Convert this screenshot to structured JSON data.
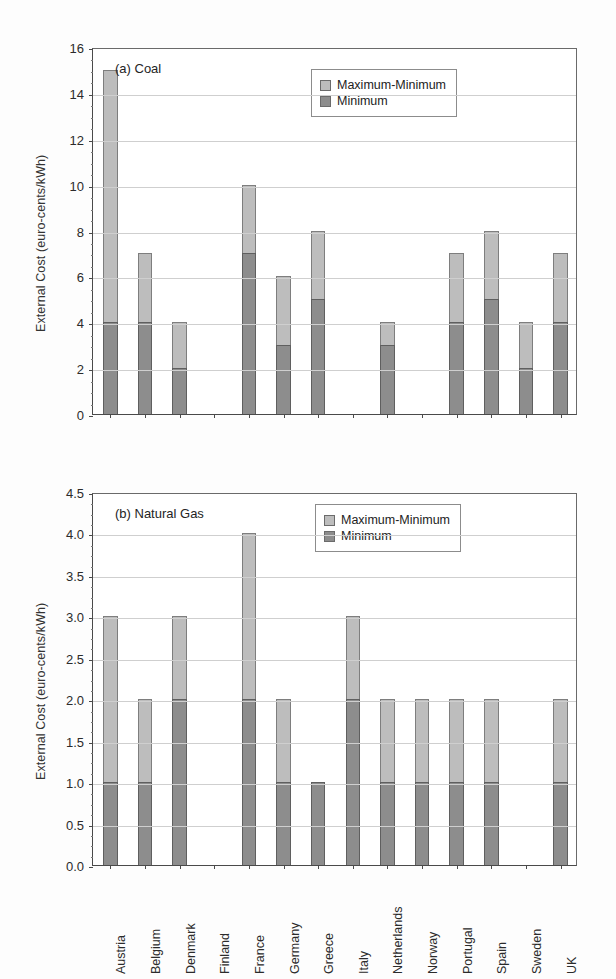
{
  "figure": {
    "ylabel": "External Cost (euro-cents/kWh)"
  },
  "legend": {
    "max_label": "Maximum-Minimum",
    "min_label": "Minimum",
    "max_color": "#bdbdbd",
    "min_color": "#8d8d8d"
  },
  "chart_data": [
    {
      "type": "bar",
      "id": "panel-a",
      "title": "(a) Coal",
      "xlabel": "",
      "ylabel": "External Cost (euro-cents/kWh)",
      "ylim": [
        0,
        16
      ],
      "yticks": [
        0,
        2,
        4,
        6,
        8,
        10,
        12,
        14,
        16
      ],
      "ytick_labels": [
        "0",
        "2",
        "4",
        "6",
        "8",
        "10",
        "12",
        "14",
        "16"
      ],
      "minor_tick_step": 0.5,
      "grid": true,
      "stacked": true,
      "legend_position": "top-right inside",
      "categories": [
        "Austria",
        "Belgium",
        "Denmark",
        "Finland",
        "France",
        "Germany",
        "Greece",
        "Italy",
        "Netherlands",
        "Norway",
        "Portugal",
        "Spain",
        "Sweden",
        "UK"
      ],
      "series": [
        {
          "name": "Minimum",
          "values": [
            4,
            4,
            2,
            null,
            7,
            3,
            5,
            null,
            3,
            null,
            4,
            5,
            2,
            4
          ]
        },
        {
          "name": "Maximum-Minimum",
          "values": [
            11,
            3,
            2,
            null,
            3,
            3,
            3,
            null,
            1,
            null,
            3,
            3,
            2,
            3
          ]
        }
      ],
      "maximum_totals": [
        15,
        7,
        4,
        null,
        10,
        6,
        8,
        null,
        4,
        null,
        7,
        8,
        4,
        7
      ],
      "no_data_categories": [
        "Finland",
        "Italy",
        "Norway"
      ]
    },
    {
      "type": "bar",
      "id": "panel-b",
      "title": "(b) Natural Gas",
      "xlabel": "",
      "ylabel": "External Cost (euro-cents/kWh)",
      "ylim": [
        0,
        4.5
      ],
      "yticks": [
        0.0,
        0.5,
        1.0,
        1.5,
        2.0,
        2.5,
        3.0,
        3.5,
        4.0,
        4.5
      ],
      "ytick_labels": [
        "0.0",
        "0.5",
        "1.0",
        "1.5",
        "2.0",
        "2.5",
        "3.0",
        "3.5",
        "4.0",
        "4.5"
      ],
      "minor_tick_step": 0.125,
      "grid": true,
      "stacked": true,
      "legend_position": "top-right inside",
      "categories": [
        "Austria",
        "Belgium",
        "Denmark",
        "Finland",
        "France",
        "Germany",
        "Greece",
        "Italy",
        "Netherlands",
        "Norway",
        "Portugal",
        "Spain",
        "Sweden",
        "UK"
      ],
      "series": [
        {
          "name": "Minimum",
          "values": [
            1.0,
            1.0,
            2.0,
            null,
            2.0,
            1.0,
            1.0,
            2.0,
            1.0,
            1.0,
            1.0,
            1.0,
            null,
            1.0
          ]
        },
        {
          "name": "Maximum-Minimum",
          "values": [
            2.0,
            1.0,
            1.0,
            null,
            2.0,
            1.0,
            0.0,
            1.0,
            1.0,
            1.0,
            1.0,
            1.0,
            null,
            1.0
          ]
        }
      ],
      "maximum_totals": [
        3.0,
        2.0,
        3.0,
        null,
        4.0,
        2.0,
        1.0,
        3.0,
        2.0,
        2.0,
        2.0,
        2.0,
        null,
        2.0
      ],
      "no_data_categories": [
        "Finland",
        "Sweden"
      ]
    }
  ],
  "xaxis": {
    "labels": [
      "Austria",
      "Belgium",
      "Denmark",
      "Finland",
      "France",
      "Germany",
      "Greece",
      "Italy",
      "Netherlands",
      "Norway",
      "Portugal",
      "Spain",
      "Sweden",
      "UK"
    ]
  }
}
